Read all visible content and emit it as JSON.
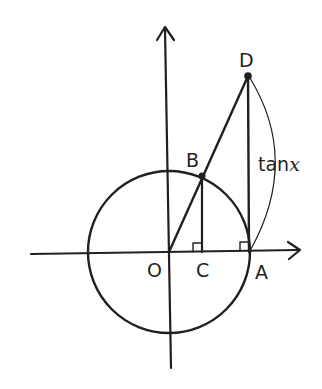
{
  "diagram": {
    "type": "unit-circle-tangent",
    "colors": {
      "ink": "#231f20",
      "background": "#ffffff"
    },
    "points": {
      "O": {
        "label": "O",
        "x": 169,
        "y": 252
      },
      "A": {
        "label": "A",
        "x": 249,
        "y": 252
      },
      "B": {
        "label": "B",
        "x": 202,
        "y": 176
      },
      "C": {
        "label": "C",
        "x": 202,
        "y": 252
      },
      "D": {
        "label": "D",
        "x": 248,
        "y": 76
      }
    },
    "labels": {
      "O": "O",
      "A": "A",
      "B": "B",
      "C": "C",
      "D": "D",
      "tan_prefix": "tan",
      "tan_var": "x"
    },
    "circle": {
      "cx": 169,
      "cy": 252,
      "r": 80
    },
    "axes": {
      "x": {
        "from": 31,
        "to": 300,
        "y": 252
      },
      "y": {
        "from": 368,
        "to": 27,
        "x": 169
      }
    },
    "right_angles": [
      "C",
      "A"
    ]
  }
}
